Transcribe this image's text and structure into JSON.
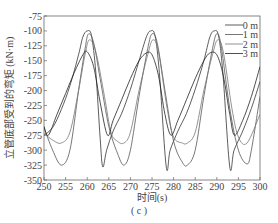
{
  "chart_data": {
    "type": "line",
    "title": "",
    "caption": "( c )",
    "xlabel": "时间(s)",
    "ylabel": "立管底部受到的弯矩 (kN·m)",
    "xlim": [
      250,
      300
    ],
    "ylim": [
      -350,
      -75
    ],
    "xticks": [
      250,
      255,
      260,
      265,
      270,
      275,
      280,
      285,
      290,
      295,
      300
    ],
    "yticks": [
      -75,
      -100,
      -125,
      -150,
      -175,
      -200,
      -225,
      -250,
      -275,
      -300,
      -325,
      -350
    ],
    "grid": false,
    "legend_position": "upper right",
    "period_s": 14.7,
    "series": [
      {
        "name": "0 m",
        "color": "#333333",
        "x": [
          250,
          252,
          254,
          256,
          258,
          259,
          260,
          261,
          262,
          263,
          263.6,
          264.5,
          266,
          268,
          270,
          272,
          273.7,
          274.7,
          275.7,
          276.7,
          278.3,
          279.2,
          281,
          283,
          285,
          287,
          288.4,
          289.4,
          290.4,
          291.4,
          293,
          294,
          296,
          298,
          300
        ],
        "values": [
          -275,
          -262,
          -232,
          -192,
          -140,
          -110,
          -100,
          -108,
          -170,
          -280,
          -328,
          -300,
          -268,
          -238,
          -198,
          -150,
          -110,
          -100,
          -108,
          -170,
          -328,
          -300,
          -268,
          -238,
          -198,
          -150,
          -110,
          -100,
          -108,
          -170,
          -328,
          -300,
          -268,
          -230,
          -185
        ]
      },
      {
        "name": "1 m",
        "color": "#555555",
        "x": [
          250,
          252,
          254,
          256,
          258,
          259.5,
          260.3,
          261.5,
          263,
          265,
          267,
          268.5,
          270,
          272,
          274,
          275,
          276.2,
          278,
          280,
          282,
          283.2,
          285,
          287,
          289,
          290,
          291,
          293,
          295,
          297,
          298,
          300
        ],
        "values": [
          -262,
          -300,
          -325,
          -300,
          -200,
          -130,
          -105,
          -120,
          -180,
          -260,
          -305,
          -325,
          -300,
          -210,
          -130,
          -105,
          -120,
          -200,
          -285,
          -320,
          -325,
          -300,
          -210,
          -130,
          -105,
          -125,
          -230,
          -300,
          -323,
          -300,
          -210
        ]
      },
      {
        "name": "2 m",
        "color": "#777777",
        "x": [
          250,
          252,
          254,
          256,
          258,
          259.5,
          260.5,
          262,
          264,
          265.5,
          267,
          268.5,
          270,
          272,
          274,
          275.2,
          276.5,
          278.5,
          280,
          282,
          283.2,
          285,
          287,
          289,
          290.2,
          291.5,
          293.5,
          295,
          297,
          300
        ],
        "values": [
          -272,
          -283,
          -288,
          -270,
          -200,
          -140,
          -115,
          -135,
          -210,
          -270,
          -285,
          -288,
          -270,
          -200,
          -140,
          -115,
          -135,
          -230,
          -278,
          -288,
          -288,
          -270,
          -200,
          -140,
          -115,
          -135,
          -230,
          -278,
          -288,
          -240
        ]
      },
      {
        "name": "3 m",
        "color": "#222222",
        "x": [
          250,
          251,
          253,
          255,
          257,
          259,
          260,
          261.5,
          263,
          264.7,
          266,
          268,
          270,
          272,
          273.7,
          275,
          276.5,
          278,
          279.4,
          281,
          283,
          285,
          287,
          288.4,
          290,
          291.5,
          293,
          294.1,
          296,
          298,
          300
        ],
        "values": [
          -260,
          -275,
          -240,
          -205,
          -170,
          -140,
          -135,
          -160,
          -220,
          -275,
          -250,
          -215,
          -180,
          -150,
          -137,
          -140,
          -175,
          -240,
          -275,
          -250,
          -215,
          -180,
          -150,
          -137,
          -140,
          -175,
          -240,
          -275,
          -250,
          -210,
          -160
        ]
      }
    ]
  },
  "legend": [
    "0 m",
    "1 m",
    "2 m",
    "3 m"
  ],
  "axes": {
    "xlabel": "时间(s)",
    "ylabel": "立管底部受到的弯矩 (kN·m)"
  },
  "caption": "( c )"
}
